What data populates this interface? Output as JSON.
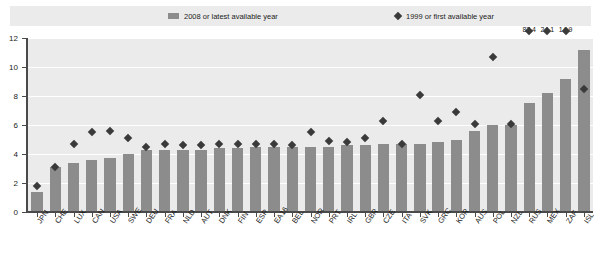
{
  "legend": {
    "bar_label": "2008 or latest available year",
    "diamond_label": "1999 or first available year",
    "bar_icon": "bar-swatch-icon",
    "diamond_icon": "diamond-marker-icon"
  },
  "axes": {
    "y_ticks": [
      "0",
      "2",
      "4",
      "6",
      "8",
      "10",
      "12"
    ],
    "y_min": 0,
    "y_max": 12
  },
  "colors": {
    "bar": "#8c8c8c",
    "marker": "#3a3a3a",
    "plot_background": "#ebebeb",
    "gridline": "#ffffff",
    "axis": "#4a4a4a",
    "text": "#1c1c1c"
  },
  "chart_data": {
    "type": "bar",
    "title": "",
    "subtitle": "",
    "xlabel": "",
    "ylabel": "",
    "ylim": [
      0,
      12
    ],
    "grid": true,
    "legend_position": "top",
    "categories": [
      "JPN",
      "CHE",
      "LUX",
      "CAN",
      "USA",
      "SWE",
      "DEU",
      "FRA",
      "NLD",
      "AUT",
      "DNK",
      "FIN",
      "ESP",
      "EA16",
      "BEL",
      "NOR",
      "PRT",
      "IRL",
      "GBR",
      "CZE",
      "ITA",
      "SVK",
      "GRC",
      "KOR",
      "AUS",
      "POL",
      "NZL",
      "RUS",
      "MEX",
      "ZAF",
      "ISL"
    ],
    "series": [
      {
        "name": "2008 or latest available year",
        "type": "bar",
        "values": [
          1.4,
          3.1,
          3.4,
          3.6,
          3.7,
          4.0,
          4.3,
          4.3,
          4.3,
          4.3,
          4.4,
          4.4,
          4.5,
          4.5,
          4.5,
          4.5,
          4.5,
          4.6,
          4.6,
          4.7,
          4.7,
          4.7,
          4.8,
          5.0,
          5.6,
          6.0,
          6.0,
          7.5,
          8.2,
          9.2,
          11.2
        ]
      },
      {
        "name": "1999 or first available year",
        "type": "scatter",
        "values": [
          1.8,
          3.1,
          4.7,
          5.5,
          5.6,
          5.1,
          4.5,
          4.7,
          4.6,
          4.6,
          4.7,
          4.7,
          4.7,
          4.7,
          4.6,
          5.5,
          4.9,
          4.8,
          5.1,
          6.3,
          4.7,
          8.1,
          6.3,
          6.9,
          6.1,
          10.7,
          6.1,
          87.4,
          24.1,
          14.9,
          8.5
        ]
      }
    ],
    "annotations": [
      {
        "category": "RUS",
        "text": "87.4"
      },
      {
        "category": "MEX",
        "text": "24.1"
      },
      {
        "category": "ZAF",
        "text": "14.9"
      }
    ]
  }
}
